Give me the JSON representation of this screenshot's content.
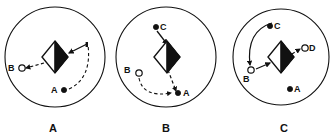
{
  "figure": {
    "title": "",
    "background_color": "#ffffff",
    "stroke_color": "#111111",
    "fill_black": "#111111",
    "fill_white": "#ffffff",
    "width": 330,
    "height": 138
  },
  "panels": [
    {
      "caption": "A",
      "caption_x": 53,
      "caption_y": 131,
      "boundary": {
        "cx": 55,
        "cy": 57,
        "r": 50
      },
      "robot": {
        "cx": 55,
        "cy": 57,
        "rx": 13,
        "ry": 16,
        "shape": "diamond",
        "right_half_filled": true
      },
      "nodes": [
        {
          "label": "B",
          "marker": "hollow-circle",
          "cx": 22,
          "cy": 68,
          "r": 3.2,
          "label_x": 8,
          "label_y": 71
        },
        {
          "label": "A",
          "marker": "filled-dot",
          "cx": 64,
          "cy": 90,
          "r": 2.6,
          "label_x": 52,
          "label_y": 93
        }
      ],
      "paths": [
        {
          "kind": "dashed-line",
          "from": "robot",
          "to": "B",
          "arrow_at": "B",
          "d": "M 44 63 L 26 68"
        },
        {
          "kind": "solid-line",
          "from": "waypoint",
          "to": "robot",
          "arrow_at": "robot",
          "d": "M 86 44 L 68 53"
        },
        {
          "kind": "dashed-arc",
          "from": "A",
          "to": "waypoint",
          "d": "M 69 89 Q 91 79 88 45"
        }
      ]
    },
    {
      "caption": "B",
      "caption_x": 166,
      "caption_y": 131,
      "boundary": {
        "cx": 166,
        "cy": 57,
        "r": 50
      },
      "robot": {
        "cx": 167,
        "cy": 57,
        "rx": 13,
        "ry": 16,
        "shape": "diamond",
        "right_half_filled": true
      },
      "nodes": [
        {
          "label": "C",
          "marker": "filled-dot",
          "cx": 156,
          "cy": 27,
          "r": 2.6,
          "label_x": 161,
          "label_y": 30
        },
        {
          "label": "B",
          "marker": "hollow-circle",
          "cx": 138,
          "cy": 72,
          "r": 3.2,
          "label_x": 124,
          "label_y": 72
        },
        {
          "label": "A",
          "marker": "filled-dot",
          "cx": 178,
          "cy": 93,
          "r": 2.6,
          "label_x": 183,
          "label_y": 96
        }
      ],
      "paths": [
        {
          "kind": "solid-line",
          "from": "C",
          "to": "robot",
          "arrow_at": "robot",
          "d": "M 157 31 L 167 45"
        },
        {
          "kind": "dashed-line",
          "from": "robot",
          "to": "A",
          "arrow_at": "A",
          "d": "M 168 70 L 176 92"
        },
        {
          "kind": "dashed-arc",
          "from": "B",
          "to": "A",
          "arrow_at": "A",
          "d": "M 139 77 Q 144 97 173 93"
        }
      ]
    },
    {
      "caption": "C",
      "caption_x": 284,
      "caption_y": 131,
      "boundary": {
        "cx": 281,
        "cy": 57,
        "r": 48
      },
      "robot": {
        "cx": 281,
        "cy": 57,
        "rx": 13,
        "ry": 16,
        "shape": "diamond",
        "right_half_filled": true
      },
      "nodes": [
        {
          "label": "C",
          "marker": "filled-dot",
          "cx": 270,
          "cy": 26,
          "r": 2.6,
          "label_x": 275,
          "label_y": 29
        },
        {
          "label": "D",
          "marker": "hollow-circle",
          "cx": 305,
          "cy": 48,
          "r": 3.2,
          "label_x": 310,
          "label_y": 51
        },
        {
          "label": "B",
          "marker": "hollow-circle",
          "cx": 251,
          "cy": 70,
          "r": 3.2,
          "label_x": 243,
          "label_y": 81
        },
        {
          "label": "A",
          "marker": "filled-dot",
          "cx": 290,
          "cy": 89,
          "r": 2.6,
          "label_x": 295,
          "label_y": 92
        }
      ],
      "paths": [
        {
          "kind": "solid-line",
          "from": "B",
          "to": "robot",
          "arrow_at": "robot",
          "d": "M 256 69 L 269 63"
        },
        {
          "kind": "dashed-line",
          "from": "robot",
          "to": "D",
          "arrow_at": "D",
          "d": "M 292 55 L 301 49"
        },
        {
          "kind": "solid-arc",
          "from": "C",
          "to": "B",
          "arrow_at": "B",
          "d": "M 272 24 Q 248 32 251 65"
        }
      ]
    }
  ],
  "legend": {
    "filled_dot_meaning": "goal",
    "hollow_circle_meaning": "waypoint",
    "diamond_meaning": "robot"
  }
}
